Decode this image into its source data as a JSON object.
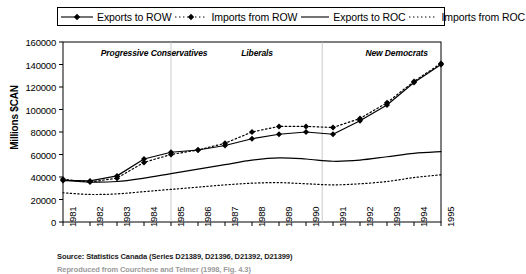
{
  "chart_data": {
    "type": "line",
    "title": "",
    "xlabel": "",
    "ylabel": "Millions $CAN",
    "x": [
      1981,
      1982,
      1983,
      1984,
      1985,
      1986,
      1987,
      1988,
      1989,
      1990,
      1991,
      1992,
      1993,
      1994,
      1995
    ],
    "xtick_labels": [
      "1981",
      "1982",
      "1983",
      "1984",
      "1985",
      "1986",
      "1987",
      "1988",
      "1989",
      "1990",
      "1991",
      "1992",
      "1993",
      "1994",
      "1995"
    ],
    "ylim": [
      0,
      160000
    ],
    "ytick_labels": [
      "0",
      "20000",
      "40000",
      "60000",
      "80000",
      "100000",
      "120000",
      "140000",
      "160000"
    ],
    "ytick_values": [
      0,
      20000,
      40000,
      60000,
      80000,
      100000,
      120000,
      140000,
      160000
    ],
    "grid": false,
    "legend_position": "top",
    "series": [
      {
        "name": "Exports to ROW",
        "style": "solid",
        "marker": "diamond",
        "values": [
          37000,
          36500,
          41000,
          56000,
          62000,
          64000,
          68000,
          74000,
          78000,
          80000,
          78000,
          90000,
          104000,
          124000,
          140000
        ]
      },
      {
        "name": "Imports from ROW",
        "style": "dotted",
        "marker": "diamond",
        "values": [
          38000,
          35500,
          39000,
          53000,
          60000,
          64000,
          70000,
          80000,
          85000,
          85000,
          84000,
          92000,
          106000,
          125000,
          141000
        ]
      },
      {
        "name": "Exports to ROC",
        "style": "solid",
        "marker": "none",
        "values": [
          37000,
          35500,
          36000,
          39000,
          43000,
          47000,
          51000,
          55000,
          57000,
          56000,
          54000,
          55000,
          58000,
          61000,
          62500
        ]
      },
      {
        "name": "Imports from ROC",
        "style": "dotted",
        "marker": "none",
        "values": [
          26000,
          24500,
          25000,
          27000,
          29000,
          31000,
          33000,
          34500,
          35000,
          34000,
          33000,
          34000,
          36000,
          39500,
          42000
        ]
      }
    ],
    "annotations": [
      {
        "text": "Progressive Conservatives",
        "x": 1982.4,
        "y": 150000
      },
      {
        "text": "Liberals",
        "x": 1987.6,
        "y": 150000
      },
      {
        "text": "New Democrats",
        "x": 1992.2,
        "y": 150000
      }
    ],
    "dividers": [
      1985.0,
      1990.6
    ]
  },
  "legend": {
    "items": [
      {
        "label": "Exports to ROW",
        "style": "solid",
        "marker": "diamond"
      },
      {
        "label": "Imports from ROW",
        "style": "dotted",
        "marker": "diamond"
      },
      {
        "label": "Exports to ROC",
        "style": "solid",
        "marker": "none"
      },
      {
        "label": "Imports from ROC",
        "style": "dotted",
        "marker": "none"
      }
    ]
  },
  "source": {
    "line1": "Source: Statistics Canada (Series D21389, D21396, D21392, D21399)",
    "line2": "Reproduced from Courchene and Telmer (1998, Fig. 4.3)"
  }
}
